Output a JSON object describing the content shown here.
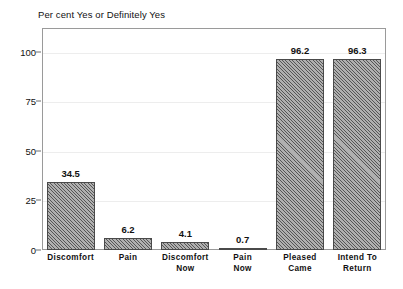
{
  "chart_data": {
    "type": "bar",
    "title": "Per cent Yes or Definitely Yes",
    "xlabel": "",
    "ylabel": "",
    "categories": [
      "Discomfort",
      "Pain",
      "Discomfort Now",
      "Pain Now",
      "Pleased Came",
      "Intend To Return"
    ],
    "category_lines": [
      [
        "Discomfort"
      ],
      [
        "Pain"
      ],
      [
        "Discomfort",
        "Now"
      ],
      [
        "Pain",
        "Now"
      ],
      [
        "Pleased",
        "Came"
      ],
      [
        "Intend To",
        "Return"
      ]
    ],
    "values": [
      34.5,
      6.2,
      4.1,
      0.7,
      96.2,
      96.3
    ],
    "value_labels": [
      "34.5",
      "6.2",
      "4.1",
      "0.7",
      "96.2",
      "96.3"
    ],
    "ylim": [
      0,
      112
    ],
    "yticks": [
      0,
      25,
      50,
      75,
      100
    ],
    "ytick_labels": [
      "0",
      "25",
      "50",
      "75",
      "100"
    ],
    "grid": true,
    "legend": false,
    "colors": {
      "bar_fill": "#8e8e8e",
      "bar_edge": "#4a4a4a",
      "frame": "#9a9a9a",
      "gridline": "#ededed",
      "text": "#111111",
      "background": "#ffffff"
    }
  }
}
